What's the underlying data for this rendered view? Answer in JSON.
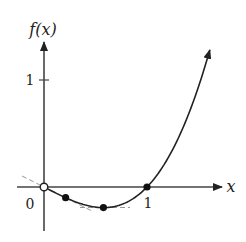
{
  "chart_data": {
    "type": "line",
    "title": "",
    "xlabel": "x",
    "ylabel": "f(x)",
    "function": "f(x) = (x^3 - x) / 2",
    "x_ticks": [
      {
        "value": 0,
        "label": "0"
      },
      {
        "value": 1,
        "label": "1"
      }
    ],
    "y_ticks": [
      {
        "value": 1,
        "label": "1"
      }
    ],
    "xlim": [
      -0.26,
      1.72
    ],
    "ylim": [
      -0.41,
      1.35
    ],
    "grid": false,
    "legend": null,
    "series": [
      {
        "name": "f(x)",
        "x": [
          0,
          0.1,
          0.2,
          0.3,
          0.4,
          0.5,
          0.577,
          0.7,
          0.8,
          0.9,
          1.0,
          1.1,
          1.2,
          1.3,
          1.4,
          1.5,
          1.61
        ],
        "y": [
          0,
          -0.0495,
          -0.096,
          -0.1365,
          -0.168,
          -0.1875,
          -0.192,
          -0.1785,
          -0.144,
          -0.0855,
          0,
          0.1155,
          0.264,
          0.4485,
          0.672,
          0.9375,
          1.28
        ]
      }
    ],
    "marked_points": [
      {
        "x": 0,
        "y": 0,
        "style": "open-circle"
      },
      {
        "x": 0.21,
        "y": -0.1,
        "style": "filled-dot"
      },
      {
        "x": 0.577,
        "y": -0.192,
        "style": "filled-dot"
      },
      {
        "x": 1,
        "y": 0,
        "style": "filled-dot"
      }
    ],
    "tangent_lines": [
      {
        "at_x": 0,
        "slope": -0.5,
        "style": "dashed"
      },
      {
        "at_x": 0.577,
        "slope": 0,
        "style": "dashed"
      }
    ]
  },
  "labels": {
    "y_axis": "f(x)",
    "x_axis": "x",
    "origin": "0",
    "x_tick_1": "1",
    "y_tick_1": "1"
  },
  "colors": {
    "axis": "#444444",
    "curve": "#222222",
    "tangent": "#999999"
  }
}
